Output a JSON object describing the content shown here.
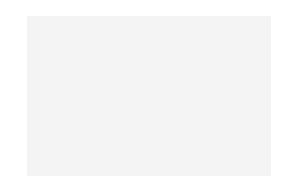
{
  "chart": {
    "title": "",
    "columns": 32,
    "rows": 19,
    "column_numbers": [
      "32",
      "30",
      "28",
      "26",
      "24",
      "22",
      "20",
      "18",
      "16",
      "14",
      "12",
      "10",
      "8",
      "6",
      "4",
      "2"
    ],
    "left_row_numbers": [
      "18",
      "16",
      "14",
      "12",
      "10",
      "8",
      "6",
      "4",
      "2"
    ],
    "right_row_numbers": [
      "19",
      "17",
      "15",
      "13",
      "11",
      "9",
      "7",
      "5",
      "3",
      "1"
    ],
    "legend": {
      "D": "dark stitch",
      "M": "medium stitch",
      "L": "light stitch"
    },
    "colors": {
      "D": "#333333",
      "M": "#7a7a7a",
      "L": "#c9c9c9",
      "grid": "#f4f4f4"
    },
    "repeat_width": 16,
    "repeat_rows_top_to_bottom": [
      "DDDDLDDDDLLLDLDL",
      "LDDDLDDDLLLDLDLD",
      "LLDDLDDLLLDLDLDL",
      "DLLDLDLLDLLDLLLD",
      "LMLLMLLMLMLLMLLM",
      "DLDLLLDLDLLDDLDD",
      "LDLDLDLDLLDDDLDD",
      "DLDLDLDLDDDDDLDD",
      "DDLDLDLDDDDDDLDD",
      "LMLLMLLMLMLLMLLM",
      "DDLDLDLDDDDDDLDD",
      "DLDLDLDLDDDDDLDD",
      "LDLDLDLDLLDDDLDD",
      "DLDLLLDLDLLDDLDD",
      "LMLLMLLMLMLLMLLM",
      "DLLDLDLLDLLDLLLD",
      "LLDDLDDLLLDLDLDL",
      "LDDDLDDDLLLDLDLD",
      "DDDDLDDDDLLLDLDL"
    ]
  }
}
